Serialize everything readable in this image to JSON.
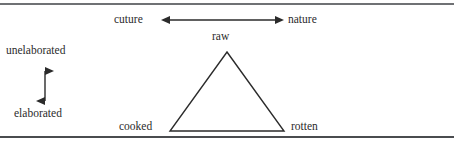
{
  "figure": {
    "title_visible": false,
    "background_color": "#ffffff",
    "line_color": "#2b2b2b",
    "rule_color": "#6f7174",
    "text_color": "#2b2b2b"
  },
  "rules": {
    "top_label": "top-horizontal-rule",
    "bottom_label": "bottom-horizontal-rule"
  },
  "axes": {
    "horizontal": {
      "left_label": "cuture",
      "right_label": "nature",
      "arrow": "double-headed-horizontal-arrow"
    },
    "vertical": {
      "top_label": "unelaborated",
      "bottom_label": "elaborated",
      "arrow": "double-headed-vertical-arrow"
    }
  },
  "triangle": {
    "name": "culinary-triangle",
    "vertices": [
      {
        "label": "raw",
        "position": "apex"
      },
      {
        "label": "cooked",
        "position": "bottom-left"
      },
      {
        "label": "rotten",
        "position": "bottom-right"
      }
    ]
  }
}
